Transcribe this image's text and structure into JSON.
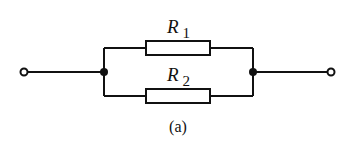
{
  "diagram": {
    "type": "circuit",
    "components": [
      {
        "id": "R1",
        "label_main": "R",
        "label_sub": "1",
        "kind": "resistor",
        "branch": "upper"
      },
      {
        "id": "R2",
        "label_main": "R",
        "label_sub": "2",
        "kind": "resistor",
        "branch": "lower"
      }
    ],
    "terminals": [
      "left-terminal",
      "right-terminal"
    ],
    "junctions": [
      "left-node",
      "right-node"
    ],
    "caption": "(a)",
    "colors": {
      "line": "#111111",
      "background": "#ffffff"
    }
  }
}
